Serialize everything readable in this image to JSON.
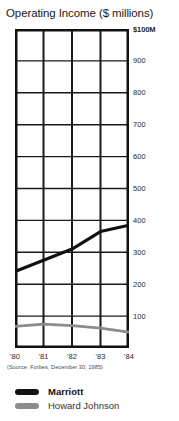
{
  "chart_data": {
    "type": "line",
    "title": "Operating Income ($ millions)",
    "xlabel": "",
    "ylabel": "",
    "x": [
      "'80",
      "'81",
      "'82",
      "'83",
      "'84"
    ],
    "categories": [
      "'80",
      "'81",
      "'82",
      "'83",
      "'84"
    ],
    "series": [
      {
        "name": "Marriott",
        "color": "#111111",
        "values": [
          240,
          275,
          310,
          365,
          385
        ]
      },
      {
        "name": "Howard Johnson",
        "color": "#8c8c8c",
        "values": [
          68,
          75,
          70,
          62,
          50
        ]
      }
    ],
    "ylim": [
      0,
      1000
    ],
    "y_ticks": [
      100,
      200,
      300,
      400,
      500,
      600,
      700,
      800,
      900,
      1000
    ],
    "y_tick_labels": [
      "100",
      "200",
      "300",
      "400",
      "500",
      "600",
      "700",
      "800",
      "900",
      "$100M"
    ],
    "grid": true,
    "legend_position": "bottom-left",
    "source_note": "(Source: Forbes, December 30, 1985)"
  },
  "title": "Operating Income ($ millions)",
  "source": "(Source: Forbes, December 30, 1985)",
  "legend": {
    "items": [
      {
        "label": "Marriott",
        "color": "#111111"
      },
      {
        "label": "Howard Johnson",
        "color": "#8c8c8c"
      }
    ]
  },
  "axes": {
    "y_labels": [
      "$100M",
      "900",
      "800",
      "700",
      "600",
      "500",
      "400",
      "300",
      "200",
      "100"
    ],
    "x_labels": [
      "'80",
      "'81",
      "'82",
      "'83",
      "'84"
    ]
  },
  "colors": {
    "marriott": "#111111",
    "howard_johnson": "#8c8c8c",
    "axis": "#111111",
    "grid": "#1a1a1a"
  }
}
